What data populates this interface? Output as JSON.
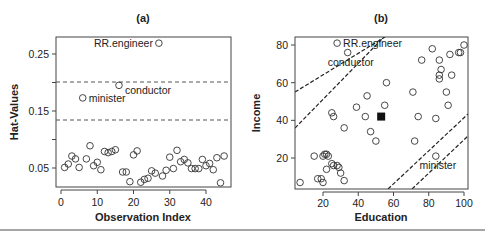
{
  "chart_data": [
    {
      "type": "scatter",
      "title": "(a)",
      "xlabel": "Observation Index",
      "ylabel": "Hat-Values",
      "xlim": [
        0,
        46
      ],
      "ylim": [
        0.015,
        0.28
      ],
      "xticks": [
        "0",
        "10",
        "20",
        "30",
        "40"
      ],
      "yticks": [
        "0.05",
        "0.15",
        "0.25"
      ],
      "reference_lines": [
        0.2,
        0.133
      ],
      "x": [
        1,
        2,
        3,
        4,
        5,
        6,
        7,
        8,
        9,
        10,
        11,
        12,
        13,
        14,
        15,
        16,
        17,
        18,
        19,
        20,
        21,
        22,
        23,
        24,
        25,
        26,
        27,
        28,
        29,
        30,
        31,
        32,
        33,
        34,
        35,
        36,
        37,
        38,
        39,
        40,
        41,
        42,
        43,
        44,
        45
      ],
      "values": [
        0.051,
        0.057,
        0.071,
        0.066,
        0.051,
        0.173,
        0.066,
        0.089,
        0.054,
        0.06,
        0.047,
        0.079,
        0.077,
        0.079,
        0.082,
        0.195,
        0.043,
        0.043,
        0.026,
        0.073,
        0.08,
        0.025,
        0.03,
        0.032,
        0.045,
        0.041,
        0.269,
        0.036,
        0.046,
        0.069,
        0.049,
        0.081,
        0.061,
        0.065,
        0.059,
        0.049,
        0.049,
        0.049,
        0.065,
        0.054,
        0.058,
        0.047,
        0.068,
        0.024,
        0.071
      ],
      "annotations": [
        {
          "label": "RR.engineer",
          "x": 27,
          "y": 0.269
        },
        {
          "label": "conductor",
          "x": 16,
          "y": 0.195
        },
        {
          "label": "minister",
          "x": 6,
          "y": 0.173
        }
      ]
    },
    {
      "type": "scatter",
      "title": "(b)",
      "xlabel": "Education",
      "ylabel": "Income",
      "xlim": [
        4,
        102
      ],
      "ylim": [
        5,
        83
      ],
      "xticks": [
        "20",
        "40",
        "60",
        "80",
        "100"
      ],
      "yticks": [
        "20",
        "40",
        "60",
        "80"
      ],
      "points": [
        [
          28,
          81
        ],
        [
          34,
          76
        ],
        [
          56,
          60
        ],
        [
          45,
          53
        ],
        [
          55,
          48
        ],
        [
          39,
          47
        ],
        [
          25,
          44
        ],
        [
          26,
          42
        ],
        [
          44,
          42
        ],
        [
          32,
          36
        ],
        [
          47,
          34
        ],
        [
          50,
          29
        ],
        [
          72,
          29
        ],
        [
          71,
          55
        ],
        [
          74,
          42
        ],
        [
          84,
          41
        ],
        [
          84,
          21
        ],
        [
          76,
          72
        ],
        [
          82,
          78
        ],
        [
          86,
          72
        ],
        [
          87,
          67
        ],
        [
          86,
          64
        ],
        [
          86,
          62
        ],
        [
          92,
          75
        ],
        [
          97,
          76
        ],
        [
          98,
          76
        ],
        [
          100,
          80
        ],
        [
          93,
          64
        ],
        [
          90,
          55
        ],
        [
          91,
          48
        ],
        [
          15,
          21
        ],
        [
          20,
          21
        ],
        [
          21,
          22
        ],
        [
          22,
          22
        ],
        [
          23,
          21
        ],
        [
          25,
          17
        ],
        [
          26,
          16
        ],
        [
          28,
          16
        ],
        [
          29,
          15
        ],
        [
          30,
          12
        ],
        [
          22,
          14
        ],
        [
          32,
          8
        ],
        [
          17,
          9
        ],
        [
          19,
          9
        ],
        [
          20,
          7
        ],
        [
          7,
          7
        ]
      ],
      "centroid": [
        53,
        42
      ],
      "annotations": [
        {
          "label": "RR.engineer",
          "x": 28,
          "y": 81
        },
        {
          "label": "conductor",
          "x": 34,
          "y": 76
        },
        {
          "label": "minister",
          "x": 84,
          "y": 21
        }
      ],
      "ellipse_lines": "dashed contour lines of constant hat-value"
    }
  ]
}
